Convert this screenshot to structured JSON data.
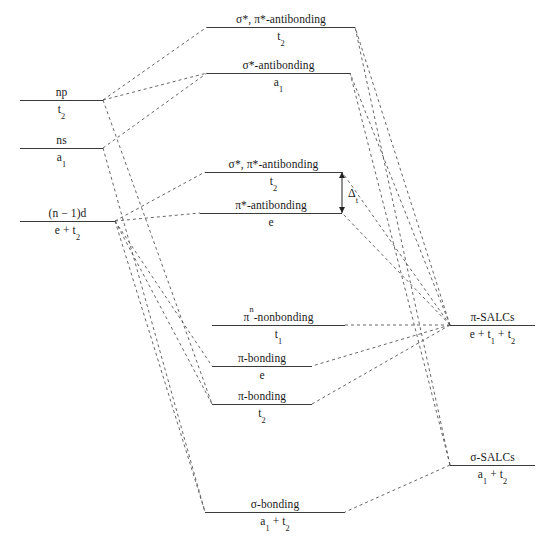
{
  "diagram": {
    "line_color": "#3a3a3a",
    "dash_color": "#555555",
    "width": 540,
    "height": 539
  },
  "metal_levels": [
    {
      "name": "metal-np",
      "top": "np",
      "bottom": "t<sub>2</sub>",
      "x1": 20,
      "x2": 103,
      "y": 100
    },
    {
      "name": "metal-ns",
      "top": "ns",
      "bottom": "a<sub>1</sub>",
      "x1": 20,
      "x2": 103,
      "y": 148
    },
    {
      "name": "metal-n-1-d",
      "top": "(n &minus; 1)d",
      "bottom": "e + t<sub>2</sub>",
      "x1": 20,
      "x2": 115,
      "y": 221
    }
  ],
  "mo_levels": [
    {
      "name": "mo-sigma-pi-antibonding-t2-upper",
      "top": "&sigma;*, &pi;*-antibonding",
      "bottom": "t<sub>2</sub>",
      "x1": 207,
      "x2": 355,
      "y": 27
    },
    {
      "name": "mo-sigma-antibonding-a1",
      "top": "&sigma;*-antibonding",
      "bottom": "a<sub>1</sub>",
      "x1": 207,
      "x2": 350,
      "y": 73
    },
    {
      "name": "mo-sigma-pi-antibonding-t2",
      "top": "&sigma;*, &pi;*-antibonding",
      "bottom": "t<sub>2</sub>",
      "x1": 205,
      "x2": 342,
      "y": 172
    },
    {
      "name": "mo-pi-antibonding-e",
      "top": "&pi;*-antibonding",
      "bottom": "e",
      "x1": 200,
      "x2": 342,
      "y": 213
    },
    {
      "name": "mo-pi-n-nonbonding-t1",
      "top": "&pi;<sup>n</sup>-nonbonding",
      "bottom": "t<sub>1</sub>",
      "x1": 212,
      "x2": 345,
      "y": 325
    },
    {
      "name": "mo-pi-bonding-e",
      "top": "&pi;-bonding",
      "bottom": "e",
      "x1": 212,
      "x2": 312,
      "y": 366
    },
    {
      "name": "mo-pi-bonding-t2",
      "top": "&pi;-bonding",
      "bottom": "t<sub>2</sub>",
      "x1": 212,
      "x2": 312,
      "y": 404
    },
    {
      "name": "mo-sigma-bonding-a1-t2",
      "top": "&sigma;-bonding",
      "bottom": "a<sub>1</sub> + t<sub>2</sub>",
      "x1": 205,
      "x2": 345,
      "y": 512
    }
  ],
  "salc_levels": [
    {
      "name": "salc-pi",
      "top": "&pi;-SALCs",
      "bottom": "e + t<sub>1</sub> + t<sub>2</sub>",
      "x1": 450,
      "x2": 535,
      "y": 325
    },
    {
      "name": "salc-sigma",
      "top": "&sigma;-SALCs",
      "bottom": "a<sub>1</sub> + t<sub>2</sub>",
      "x1": 450,
      "x2": 535,
      "y": 465
    }
  ],
  "annotations": [
    {
      "name": "delta-t-splitting",
      "text": "&Delta;<sub>t</sub>",
      "x": 348,
      "y": 193
    }
  ],
  "correlations": [
    {
      "from": "metal-np-right",
      "x1": 103,
      "y1": 100,
      "x2": 207,
      "y2": 27
    },
    {
      "from": "metal-np-right",
      "x1": 103,
      "y1": 100,
      "x2": 207,
      "y2": 73
    },
    {
      "from": "metal-ns-right",
      "x1": 103,
      "y1": 148,
      "x2": 207,
      "y2": 73
    },
    {
      "from": "metal-ns-down",
      "x1": 103,
      "y1": 148,
      "x2": 205,
      "y2": 512
    },
    {
      "from": "metal-np-down",
      "x1": 103,
      "y1": 100,
      "x2": 212,
      "y2": 404
    },
    {
      "from": "metal-d-right",
      "x1": 115,
      "y1": 221,
      "x2": 205,
      "y2": 172
    },
    {
      "from": "metal-d-right",
      "x1": 115,
      "y1": 221,
      "x2": 200,
      "y2": 213
    },
    {
      "from": "metal-d-down",
      "x1": 115,
      "y1": 221,
      "x2": 212,
      "y2": 366
    },
    {
      "from": "metal-d-down",
      "x1": 115,
      "y1": 221,
      "x2": 212,
      "y2": 404
    },
    {
      "from": "metal-d-down",
      "x1": 115,
      "y1": 221,
      "x2": 205,
      "y2": 512
    },
    {
      "from": "salc-pi-left",
      "x1": 450,
      "y1": 325,
      "x2": 355,
      "y2": 27
    },
    {
      "from": "salc-pi-left",
      "x1": 450,
      "y1": 325,
      "x2": 350,
      "y2": 73
    },
    {
      "from": "salc-pi-left",
      "x1": 450,
      "y1": 325,
      "x2": 342,
      "y2": 172
    },
    {
      "from": "salc-pi-left",
      "x1": 450,
      "y1": 325,
      "x2": 342,
      "y2": 213
    },
    {
      "from": "salc-pi-left",
      "x1": 450,
      "y1": 325,
      "x2": 345,
      "y2": 325
    },
    {
      "from": "salc-pi-left",
      "x1": 450,
      "y1": 325,
      "x2": 312,
      "y2": 366
    },
    {
      "from": "salc-pi-left",
      "x1": 450,
      "y1": 325,
      "x2": 312,
      "y2": 404
    },
    {
      "from": "salc-sigma-left",
      "x1": 450,
      "y1": 465,
      "x2": 355,
      "y2": 27
    },
    {
      "from": "salc-sigma-left",
      "x1": 450,
      "y1": 465,
      "x2": 350,
      "y2": 73
    },
    {
      "from": "salc-sigma-left",
      "x1": 450,
      "y1": 465,
      "x2": 345,
      "y2": 512
    }
  ]
}
